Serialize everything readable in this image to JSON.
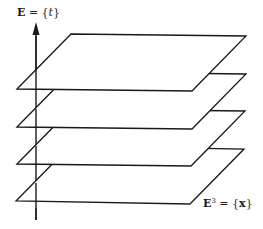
{
  "diagram": {
    "type": "fibration / foliation of spacetime",
    "time_axis": {
      "label_symbol": "E",
      "label_eq": " = {",
      "label_var": "t",
      "label_close": "}",
      "full_label": "E = {t}",
      "direction": "up"
    },
    "space_label": {
      "symbol": "E",
      "superscript": "3",
      "eq": " = {",
      "var": "x",
      "close": "}",
      "full_label": "E³ = {x}"
    },
    "planes": [
      {
        "id": "slice-1",
        "points": "17,89 71,34 246,36 192,91"
      },
      {
        "id": "slice-2",
        "points": "17,127 71,72 246,74 192,129"
      },
      {
        "id": "slice-3",
        "points": "17,164 71,109 245,111 191,166"
      },
      {
        "id": "slice-4",
        "points": "16,201 70,146 244,149 190,204"
      }
    ],
    "colors": {
      "stroke": "#1a1a1a",
      "background": "#ffffff"
    }
  }
}
